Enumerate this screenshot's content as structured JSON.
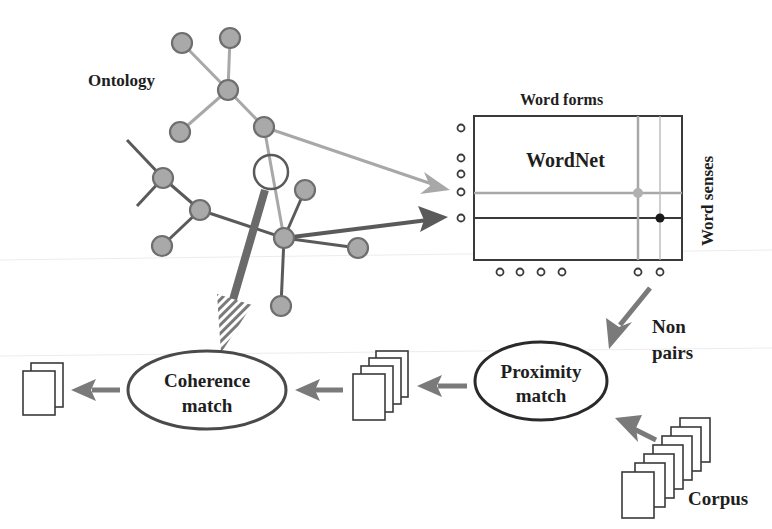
{
  "labels": {
    "ontology": "Ontology",
    "word_forms": "Word forms",
    "wordnet": "WordNet",
    "word_senses": "Word senses",
    "non": "Non",
    "pairs": "pairs",
    "proximity_line1": "Proximity",
    "proximity_line2": "match",
    "coherence_line1": "Coherence",
    "coherence_line2": "match",
    "corpus": "Corpus"
  },
  "colors": {
    "node_fill": "#a9a9a9",
    "node_stroke": "#6e6e6e",
    "light_edge": "#a8a8a8",
    "dark_edge": "#5a5a5a",
    "arrow": "#7a7a7a",
    "text": "#1e1e1e"
  },
  "ontology": {
    "nodes": [
      {
        "id": "n1",
        "x": 182,
        "y": 43
      },
      {
        "id": "n2",
        "x": 230,
        "y": 38
      },
      {
        "id": "n3",
        "x": 228,
        "y": 90
      },
      {
        "id": "n4",
        "x": 180,
        "y": 132
      },
      {
        "id": "n5",
        "x": 264,
        "y": 127
      },
      {
        "id": "n6",
        "x": 163,
        "y": 178
      },
      {
        "id": "n7",
        "x": 200,
        "y": 210
      },
      {
        "id": "n8",
        "x": 162,
        "y": 246
      },
      {
        "id": "hub",
        "x": 284,
        "y": 238
      },
      {
        "id": "n10",
        "x": 305,
        "y": 190
      },
      {
        "id": "n11",
        "x": 358,
        "y": 248
      },
      {
        "id": "n12",
        "x": 281,
        "y": 306
      }
    ],
    "selected_concept": {
      "x": 271,
      "y": 172,
      "r": 18
    }
  },
  "wordnet": {
    "sense_markers": 5,
    "form_markers": 6,
    "highlight_light": {
      "row": 4,
      "col": 5
    },
    "highlight_dark": {
      "row": 5,
      "col": 6
    }
  },
  "stacks": {
    "output_pages": 2,
    "intermediate_pages": 4,
    "corpus_pages": 7
  }
}
